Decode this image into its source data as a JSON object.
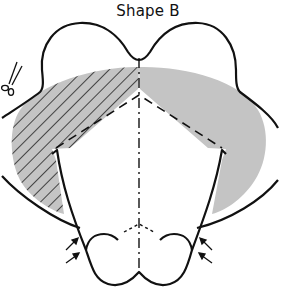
{
  "title": "Shape B",
  "icons": {
    "scissors": "scissors-icon",
    "arrows": "arrow-icon"
  },
  "colors": {
    "outline": "#111111",
    "fill_gray": "#c4c4c4",
    "hatch": "#222222",
    "background": "#ffffff"
  },
  "legend": {
    "hatched_region": "left hatched gray area",
    "solid_region": "right solid gray area",
    "dashed_lines": "fold lines",
    "dash_dot_line": "center line"
  }
}
